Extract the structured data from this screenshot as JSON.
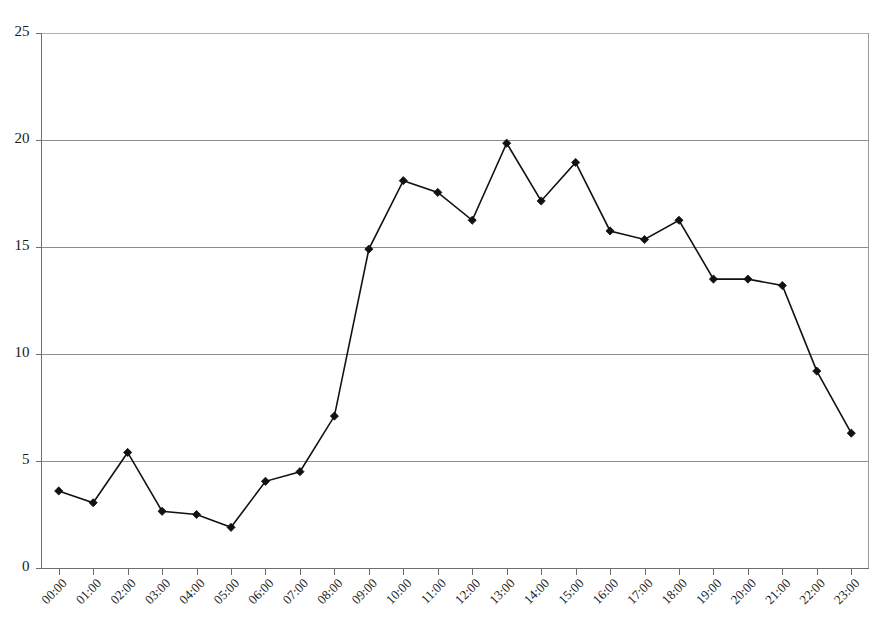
{
  "chart_data": {
    "type": "line",
    "title": "",
    "subtitle": "",
    "xlabel": "",
    "ylabel": "",
    "ylim": [
      0,
      25
    ],
    "yticks": [
      0,
      5,
      10,
      15,
      20,
      25
    ],
    "ytick_labels": [
      "0",
      "5",
      "10",
      "15",
      "20",
      "25"
    ],
    "grid": true,
    "grid_axis": "y",
    "legend": false,
    "legend_position": "none",
    "marker": "diamond",
    "line_color": "#111111",
    "marker_color": "#111111",
    "background_color": "#ffffff",
    "gridline_color": "#8c8c8c",
    "xtick_rotation": 45,
    "categories": [
      "00:00",
      "01:00",
      "02:00",
      "03:00",
      "04:00",
      "05:00",
      "06:00",
      "07:00",
      "08:00",
      "09:00",
      "10:00",
      "11:00",
      "12:00",
      "13:00",
      "14:00",
      "15:00",
      "16:00",
      "17:00",
      "18:00",
      "19:00",
      "20:00",
      "21:00",
      "22:00",
      "23:00"
    ],
    "values": [
      3.6,
      3.05,
      5.4,
      2.65,
      2.5,
      1.9,
      4.05,
      4.5,
      7.1,
      14.9,
      18.1,
      17.55,
      16.25,
      19.85,
      17.15,
      18.95,
      15.75,
      15.35,
      16.25,
      13.5,
      13.5,
      13.2,
      9.2,
      6.3
    ],
    "series": [
      {
        "name": "",
        "values": [
          3.6,
          3.05,
          5.4,
          2.65,
          2.5,
          1.9,
          4.05,
          4.5,
          7.1,
          14.9,
          18.1,
          17.55,
          16.25,
          19.85,
          17.15,
          18.95,
          15.75,
          15.35,
          16.25,
          13.5,
          13.5,
          13.2,
          9.2,
          6.3
        ]
      }
    ]
  }
}
